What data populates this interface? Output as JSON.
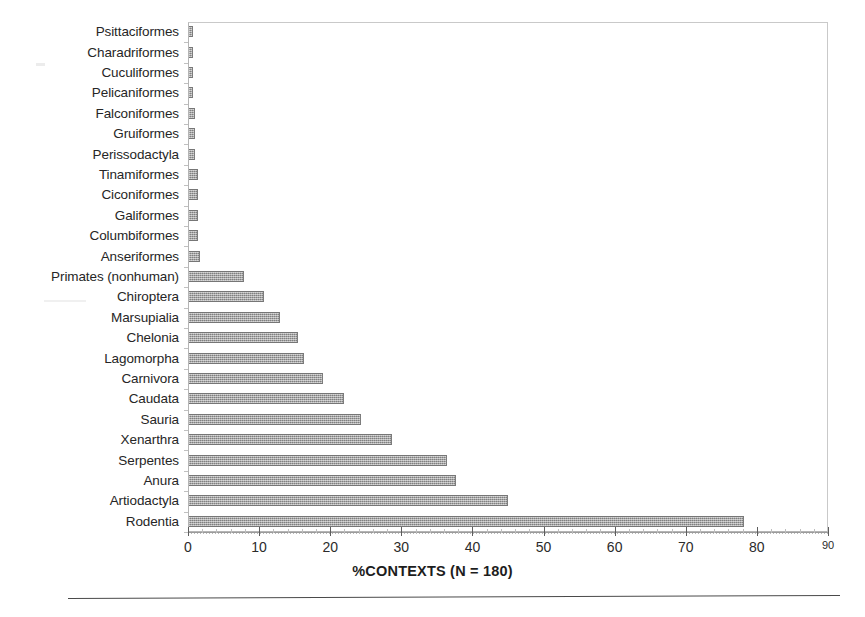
{
  "chart_data": {
    "type": "bar",
    "orientation": "horizontal",
    "title": "",
    "xlabel": "%CONTEXTS (N = 180)",
    "ylabel": "",
    "xlim": [
      0,
      90
    ],
    "xticks": [
      0,
      10,
      20,
      30,
      40,
      50,
      60,
      70,
      80,
      90
    ],
    "grid": false,
    "legend": null,
    "sample_size": 180,
    "bar_color": "#9a9a9a",
    "categories": [
      "Psittaciformes",
      "Charadriformes",
      "Cuculiformes",
      "Pelicaniformes",
      "Falconiformes",
      "Gruiformes",
      "Perissodactyla",
      "Tinamiformes",
      "Ciconiformes",
      "Galiformes",
      "Columbiformes",
      "Anseriformes",
      "Primates (nonhuman)",
      "Chiroptera",
      "Marsupialia",
      "Chelonia",
      "Lagomorpha",
      "Carnivora",
      "Caudata",
      "Sauria",
      "Xenarthra",
      "Serpentes",
      "Anura",
      "Artiodactyla",
      "Rodentia"
    ],
    "values": [
      0.55,
      0.55,
      0.55,
      0.55,
      0.8,
      0.8,
      0.9,
      1.3,
      1.3,
      1.3,
      1.3,
      1.6,
      7.7,
      10.5,
      12.8,
      15.3,
      16.2,
      18.9,
      21.8,
      24.2,
      28.6,
      36.3,
      37.6,
      44.8,
      78.0
    ]
  },
  "axis": {
    "tick_labels": [
      "0",
      "10",
      "20",
      "30",
      "40",
      "50",
      "60",
      "70",
      "80",
      "90"
    ],
    "title_text": "%CONTEXTS (N = 180)"
  }
}
